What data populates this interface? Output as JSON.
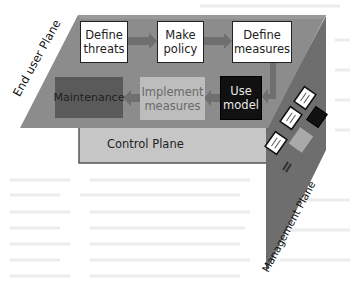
{
  "diagram": {
    "planes": {
      "end_user": {
        "label": "End user Plane",
        "color": "#8c8c8c"
      },
      "control": {
        "label": "Control Plane",
        "color": "#c6c6c6"
      },
      "management": {
        "label": "Management Plane",
        "color": "#6e6e6e"
      }
    },
    "nodes": {
      "define_threats": {
        "label": "Define\nthreats",
        "style": "white"
      },
      "make_policy": {
        "label": "Make\npolicy",
        "style": "white"
      },
      "define_measures": {
        "label": "Define\nmeasures",
        "style": "white"
      },
      "use_model": {
        "label": "Use\nmodel",
        "style": "black"
      },
      "implement_measures": {
        "label": "Implement\nmeasures",
        "style": "light-gray"
      },
      "maintenance": {
        "label": "Maintenance",
        "style": "dark-gray"
      }
    },
    "edges": [
      {
        "from": "Define threats",
        "to": "Make policy"
      },
      {
        "from": "Make policy",
        "to": "Define measures"
      },
      {
        "from": "Define measures",
        "to": "Use model"
      },
      {
        "from": "Use model",
        "to": "Implement measures"
      },
      {
        "from": "Implement measures",
        "to": "Maintenance"
      }
    ],
    "colors": {
      "arrow": "#6f6f6f",
      "plane_edge": "#555555"
    }
  }
}
